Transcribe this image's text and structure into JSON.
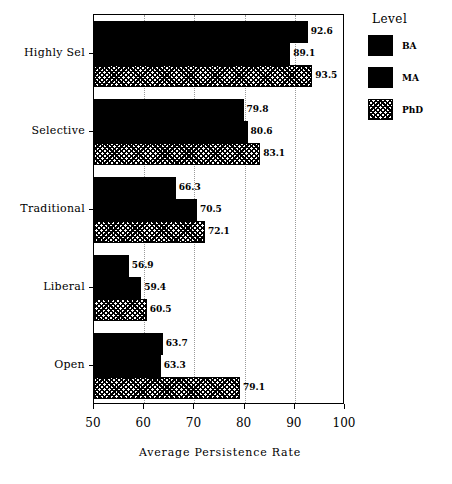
{
  "chart_data": {
    "type": "bar",
    "orientation": "horizontal",
    "title": "",
    "xlabel": "Average Persistence Rate",
    "ylabel": "",
    "xlim": [
      50,
      100
    ],
    "xticks": [
      50,
      60,
      70,
      80,
      90,
      100
    ],
    "grid": true,
    "grid_axis": "x",
    "legend_title": "Level",
    "legend_position": "right",
    "categories": [
      "Highly Sel",
      "Selective",
      "Traditional",
      "Liberal",
      "Open"
    ],
    "series": [
      {
        "name": "BA",
        "style": "solid-black",
        "values": [
          92.6,
          79.8,
          66.3,
          56.9,
          63.7
        ]
      },
      {
        "name": "MA",
        "style": "solid-black",
        "values": [
          89.1,
          80.6,
          70.5,
          59.4,
          63.3
        ]
      },
      {
        "name": "PhD",
        "style": "hatched",
        "values": [
          93.5,
          83.1,
          72.1,
          60.5,
          79.1
        ]
      }
    ],
    "value_labels": [
      [
        "92.6",
        "89.1",
        "93.5"
      ],
      [
        "79.8",
        "80.6",
        "83.1"
      ],
      [
        "66.3",
        "70.5",
        "72.1"
      ],
      [
        "56.9",
        "59.4",
        "60.5"
      ],
      [
        "63.7",
        "63.3",
        "79.1"
      ]
    ],
    "colors": {
      "bar_solid": "#000000",
      "bar_hatch_fg": "#000000",
      "bar_hatch_bg": "#ffffff",
      "axis": "#000000",
      "grid": "#9a9a9a",
      "background": "#ffffff"
    }
  }
}
